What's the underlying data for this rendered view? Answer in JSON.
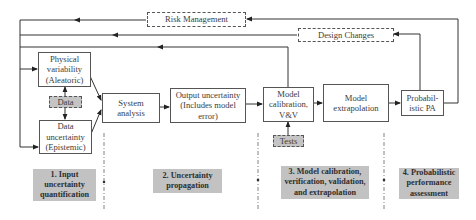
{
  "feedback": {
    "risk_management": "Risk Management",
    "design_changes": "Design Changes"
  },
  "nodes": {
    "physical_variability": {
      "line1": "Physical",
      "line2": "variability",
      "line3": "(Aleatoric)"
    },
    "data_input": "Data",
    "data_uncertainty": {
      "line1": "Data",
      "line2": "uncertainty",
      "line3": "(Epistemic)"
    },
    "system_analysis": {
      "line1": "System",
      "line2": "analysis"
    },
    "output_uncertainty": {
      "line1": "Output uncertainty",
      "line2": "(Includes model",
      "line3": "error)"
    },
    "model_calibration": {
      "line1": "Model",
      "line2": "calibration,",
      "line3": "V&V"
    },
    "tests": "Tests",
    "model_extrapolation": {
      "line1": "Model",
      "line2": "extrapolation"
    },
    "probabilistic_pa": {
      "line1": "Probabil-",
      "line2": "istic PA"
    }
  },
  "stages": [
    {
      "line1": "1. Input",
      "line2": "uncertainty",
      "line3": "quantification"
    },
    {
      "line1": "2. Uncertainty",
      "line2": "propagation"
    },
    {
      "line1": "3. Model calibration,",
      "line2": "verification, validation,",
      "line3": "and extrapolation"
    },
    {
      "line1": "4. Probabilistic",
      "line2": "performance",
      "line3": "assessment"
    }
  ],
  "colors": {
    "line": "#333333",
    "stage_fill": "#c2c2c2",
    "input_fill": "#c4c4c4"
  }
}
